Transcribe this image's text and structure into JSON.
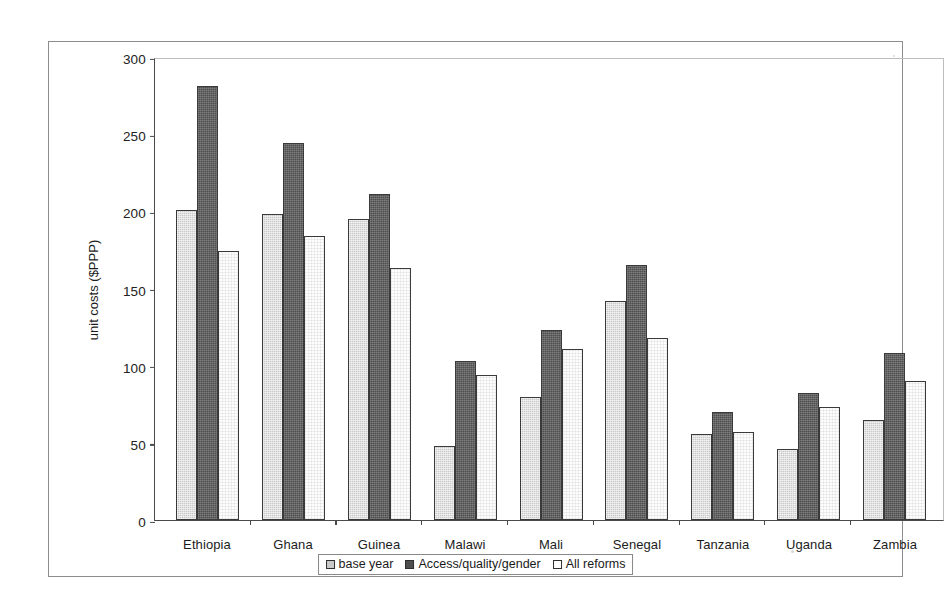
{
  "chart_data": {
    "type": "bar",
    "title": "",
    "xlabel": "",
    "ylabel": "unit costs ($PPP)",
    "ylim": [
      0,
      300
    ],
    "yticks": [
      0,
      50,
      100,
      150,
      200,
      250,
      300
    ],
    "grid": false,
    "legend_position": "bottom",
    "categories": [
      "Ethiopia",
      "Ghana",
      "Guinea",
      "Malawi",
      "Mali",
      "Senegal",
      "Tanzania",
      "Uganda",
      "Zambia"
    ],
    "series": [
      {
        "name": "base year",
        "fill": "#c9c9c9",
        "values": [
          201,
          198,
          195,
          48,
          80,
          142,
          56,
          46,
          65
        ]
      },
      {
        "name": "Access/quality/gender",
        "fill": "#4e4e4e",
        "values": [
          281,
          244,
          211,
          103,
          123,
          165,
          70,
          82,
          108
        ]
      },
      {
        "name": "All reforms",
        "fill": "#ffffff",
        "values": [
          174,
          184,
          163,
          94,
          111,
          118,
          57,
          73,
          90
        ]
      }
    ]
  },
  "legend": {
    "items": [
      {
        "label": "base year"
      },
      {
        "label": "Access/quality/gender"
      },
      {
        "label": "All reforms"
      }
    ]
  }
}
